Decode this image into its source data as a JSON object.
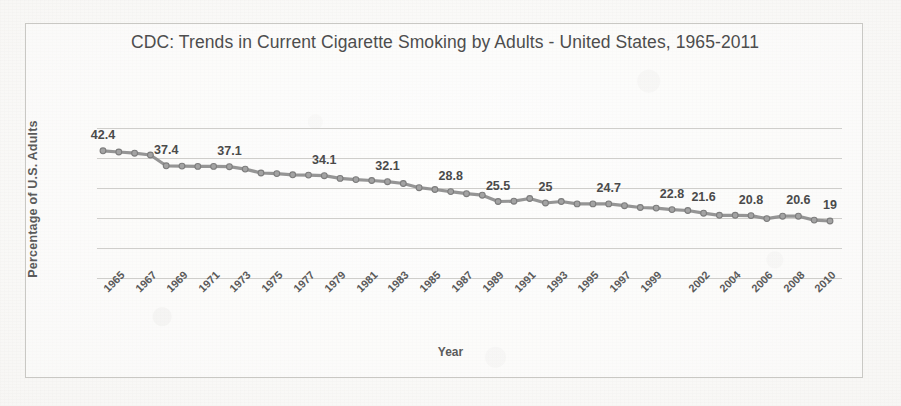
{
  "chart_data": {
    "type": "line",
    "title": "CDC: Trends in Current Cigarette Smoking by Adults - United States, 1965-2011",
    "xlabel": "Year",
    "ylabel": "Percentage of U.S. Adults",
    "ylim": [
      0,
      50
    ],
    "yticks": [
      0,
      10,
      20,
      30,
      40,
      50
    ],
    "grid": true,
    "legend": "none",
    "line_color": "#8c8c8c",
    "marker_color": "#8c8c8c",
    "x_tick_labels": [
      "1965",
      "1967",
      "1969",
      "1971",
      "1973",
      "1975",
      "1977",
      "1979",
      "1981",
      "1983",
      "1985",
      "1987",
      "1989",
      "1991",
      "1993",
      "1995",
      "1997",
      "1999",
      "2002",
      "2004",
      "2006",
      "2008",
      "2010"
    ],
    "x": [
      1965,
      1966,
      1967,
      1968,
      1969,
      1970,
      1971,
      1972,
      1973,
      1974,
      1975,
      1976,
      1977,
      1978,
      1979,
      1980,
      1981,
      1982,
      1983,
      1984,
      1985,
      1986,
      1987,
      1988,
      1989,
      1990,
      1991,
      1992,
      1993,
      1994,
      1995,
      1996,
      1997,
      1998,
      1999,
      2000,
      2001,
      2002,
      2003,
      2004,
      2005,
      2006,
      2007,
      2008,
      2009,
      2010,
      2011
    ],
    "values": [
      42.4,
      42.0,
      41.6,
      41.0,
      37.4,
      37.3,
      37.2,
      37.2,
      37.1,
      36.3,
      35.0,
      34.8,
      34.4,
      34.3,
      34.1,
      33.2,
      32.8,
      32.5,
      32.1,
      31.5,
      30.1,
      29.5,
      28.8,
      28.1,
      27.6,
      25.5,
      25.6,
      26.5,
      25.0,
      25.5,
      24.7,
      24.7,
      24.7,
      24.1,
      23.5,
      23.3,
      22.8,
      22.5,
      21.6,
      20.9,
      20.9,
      20.8,
      19.8,
      20.6,
      20.6,
      19.3,
      19.0
    ],
    "point_labels": [
      {
        "year": 1965,
        "value": 42.4,
        "text": "42.4"
      },
      {
        "year": 1969,
        "value": 37.4,
        "text": "37.4"
      },
      {
        "year": 1973,
        "value": 37.1,
        "text": "37.1"
      },
      {
        "year": 1979,
        "value": 34.1,
        "text": "34.1"
      },
      {
        "year": 1983,
        "value": 32.1,
        "text": "32.1"
      },
      {
        "year": 1987,
        "value": 28.8,
        "text": "28.8"
      },
      {
        "year": 1990,
        "value": 25.5,
        "text": "25.5"
      },
      {
        "year": 1993,
        "value": 25.0,
        "text": "25"
      },
      {
        "year": 1997,
        "value": 24.7,
        "text": "24.7"
      },
      {
        "year": 2001,
        "value": 22.8,
        "text": "22.8"
      },
      {
        "year": 2003,
        "value": 21.6,
        "text": "21.6"
      },
      {
        "year": 2006,
        "value": 20.8,
        "text": "20.8"
      },
      {
        "year": 2009,
        "value": 20.6,
        "text": "20.6"
      },
      {
        "year": 2011,
        "value": 19.0,
        "text": "19"
      }
    ]
  }
}
